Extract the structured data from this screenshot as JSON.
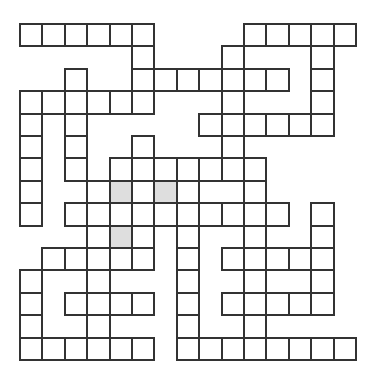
{
  "puzzle": {
    "type": "crossword-grid",
    "columns": 15,
    "rows": 15,
    "cell_size_px": 22.4,
    "origin_px": [
      19,
      23
    ],
    "colors": {
      "border": "#333333",
      "cell": "#ffffff",
      "shaded": "#dedede",
      "background": "#ffffff"
    },
    "grid_rows": [
      {
        "row": 0,
        "cells": [
          0,
          1,
          2,
          3,
          4,
          5,
          10,
          11,
          12,
          13,
          14
        ]
      },
      {
        "row": 1,
        "cells": [
          5,
          9,
          13
        ]
      },
      {
        "row": 2,
        "cells": [
          2,
          5,
          6,
          7,
          8,
          9,
          10,
          11,
          13
        ]
      },
      {
        "row": 3,
        "cells": [
          0,
          1,
          2,
          3,
          4,
          5,
          9,
          13
        ]
      },
      {
        "row": 4,
        "cells": [
          0,
          2,
          8,
          9,
          10,
          11,
          12,
          13
        ]
      },
      {
        "row": 5,
        "cells": [
          0,
          2,
          5,
          9
        ]
      },
      {
        "row": 6,
        "cells": [
          0,
          2,
          4,
          5,
          6,
          7,
          8,
          9,
          10
        ]
      },
      {
        "row": 7,
        "cells": [
          0,
          3,
          4,
          5,
          6,
          7,
          10
        ]
      },
      {
        "row": 8,
        "cells": [
          0,
          2,
          3,
          4,
          5,
          6,
          7,
          8,
          9,
          10,
          11,
          13
        ]
      },
      {
        "row": 9,
        "cells": [
          3,
          4,
          5,
          7,
          10,
          13
        ]
      },
      {
        "row": 10,
        "cells": [
          1,
          2,
          3,
          4,
          5,
          7,
          9,
          10,
          11,
          12,
          13
        ]
      },
      {
        "row": 11,
        "cells": [
          0,
          3,
          7,
          10,
          13
        ]
      },
      {
        "row": 12,
        "cells": [
          0,
          2,
          3,
          4,
          5,
          7,
          9,
          10,
          11,
          12,
          13
        ]
      },
      {
        "row": 13,
        "cells": [
          0,
          3,
          7,
          10
        ]
      },
      {
        "row": 14,
        "cells": [
          0,
          1,
          2,
          3,
          4,
          5,
          7,
          8,
          9,
          10,
          11,
          12,
          13,
          14
        ]
      }
    ],
    "shaded_cells": [
      [
        7,
        4
      ],
      [
        7,
        6
      ],
      [
        9,
        4
      ]
    ]
  }
}
